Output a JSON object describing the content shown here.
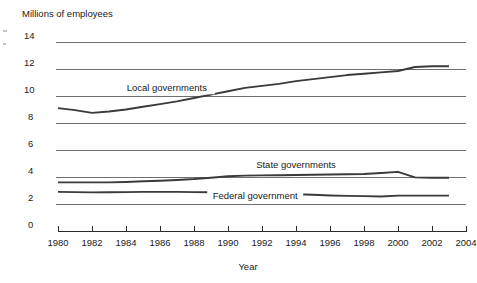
{
  "chart_data": {
    "type": "line",
    "title": "",
    "ylabel": "Millions of employees",
    "xlabel": "Year",
    "ylim": [
      0,
      14
    ],
    "xlim": [
      1980,
      2004
    ],
    "grid": true,
    "legend_position": "inline-annotations",
    "ytick_labels": [
      "14",
      "12",
      "10",
      "8",
      "6",
      "4",
      "2",
      "0"
    ],
    "yticks": [
      14,
      12,
      10,
      8,
      6,
      4,
      2,
      0
    ],
    "xtick_labels": [
      "1980",
      "1982",
      "1984",
      "1986",
      "1988",
      "1990",
      "1992",
      "1994",
      "1996",
      "1998",
      "2000",
      "2002",
      "2004"
    ],
    "xticks": [
      1980,
      1982,
      1984,
      1986,
      1988,
      1990,
      1992,
      1994,
      1996,
      1998,
      2000,
      2002,
      2004
    ],
    "x": [
      1980,
      1981,
      1982,
      1983,
      1984,
      1985,
      1986,
      1987,
      1988,
      1989,
      1990,
      1991,
      1992,
      1993,
      1994,
      1995,
      1996,
      1997,
      1998,
      1999,
      2000,
      2001,
      2002,
      2003
    ],
    "series": [
      {
        "name": "Local governments",
        "label": "Local governments",
        "color": "#3a3a3a",
        "values": [
          9.1,
          8.95,
          8.75,
          8.85,
          9.0,
          9.2,
          9.4,
          9.6,
          9.85,
          10.1,
          10.35,
          10.6,
          10.75,
          10.9,
          11.1,
          11.25,
          11.4,
          11.55,
          11.65,
          11.75,
          11.85,
          12.15,
          12.2,
          12.2
        ]
      },
      {
        "name": "State governments",
        "label": "State governments",
        "color": "#3a3a3a",
        "values": [
          3.6,
          3.6,
          3.6,
          3.6,
          3.63,
          3.68,
          3.72,
          3.78,
          3.85,
          3.95,
          4.05,
          4.1,
          4.12,
          4.13,
          4.15,
          4.17,
          4.18,
          4.2,
          4.22,
          4.3,
          4.38,
          3.97,
          3.95,
          3.95
        ]
      },
      {
        "name": "Federal government",
        "label": "Federal government",
        "color": "#6a6a6a",
        "values": [
          2.9,
          2.88,
          2.86,
          2.87,
          2.88,
          2.9,
          2.9,
          2.9,
          2.88,
          2.87,
          2.86,
          2.82,
          2.78,
          2.75,
          2.72,
          2.68,
          2.63,
          2.6,
          2.58,
          2.55,
          2.62,
          2.62,
          2.62,
          2.62
        ]
      }
    ],
    "annotations": [
      {
        "text": "Local governments",
        "x": 1986.4,
        "y": 10.35,
        "name": "local-governments-label"
      },
      {
        "text": "State governments",
        "x": 1994.0,
        "y": 4.65,
        "name": "state-governments-label"
      },
      {
        "text": "Federal government",
        "x": 1991.6,
        "y": 2.38,
        "name": "federal-government-label"
      }
    ]
  },
  "axes": {
    "y_axis_title": "Millions of employees",
    "x_axis_title": "Year"
  },
  "colors": {
    "gridline": "#6f6f6f",
    "axis": "#2b2b2b",
    "series_dark": "#3a3a3a",
    "series_light": "#6a6a6a",
    "background": "#ffffff",
    "text": "#1a1a1a"
  }
}
